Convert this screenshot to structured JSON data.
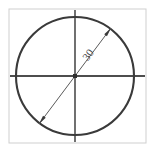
{
  "figure": {
    "background_color": "#ffffff"
  },
  "frame": {
    "name": "image-border",
    "x": 9,
    "y": 9,
    "width": 137,
    "height": 134,
    "stroke_color": "#cfcfcf",
    "stroke_width": 1
  },
  "circle": {
    "name": "circle-outline",
    "center_x": 75,
    "center_y": 76,
    "radius": 59,
    "stroke_color": "#3a3a3a",
    "stroke_width": 2.1
  },
  "center_mark": {
    "name": "center-point",
    "x": 75,
    "y": 76,
    "size": 4,
    "color": "#2e2e2e"
  },
  "axes": {
    "horizontal": {
      "name": "horizontal-center-line",
      "x1": 10,
      "y1": 76,
      "x2": 145,
      "y2": 76,
      "stroke_color": "#4d4d4d",
      "stroke_width": 2
    },
    "vertical": {
      "name": "vertical-center-line",
      "x1": 75,
      "y1": 10,
      "x2": 75,
      "y2": 142,
      "stroke_color": "#4d4d4d",
      "stroke_width": 1.6
    }
  },
  "dimension": {
    "name": "diameter-dimension-line",
    "label": "30",
    "label_x": 91,
    "label_y": 57,
    "label_rotation": -53,
    "label_color": "#4a4a4a",
    "stroke_color": "#5a5a5a",
    "stroke_width": 1,
    "start_x": 39,
    "start_y": 124,
    "end_x": 111,
    "end_y": 28,
    "arrowhead_length": 9,
    "arrowhead_width": 3.4,
    "arrowhead_color": "#3a3a3a",
    "arrow_start_name": "arrowhead-lower-left",
    "arrow_end_name": "arrowhead-upper-right"
  }
}
